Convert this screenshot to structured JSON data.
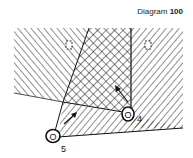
{
  "title": {
    "prefix": "Diagram",
    "number": "100"
  },
  "players": [
    {
      "id": "player-4",
      "label": "4",
      "x": 128,
      "y": 114
    },
    {
      "id": "player-5",
      "label": "5",
      "x": 53,
      "y": 137
    }
  ],
  "markers": [
    {
      "id": "dashed-marker-left",
      "x": 69,
      "y": 45
    },
    {
      "id": "dashed-marker-right",
      "x": 148,
      "y": 45
    }
  ],
  "zones": [
    {
      "id": "left-hatched-zone",
      "pattern": "diagonal-right"
    },
    {
      "id": "center-crosshatched-zone",
      "pattern": "crosshatch"
    },
    {
      "id": "right-hatched-zone",
      "pattern": "diagonal-left"
    },
    {
      "id": "lower-hatched-zone",
      "pattern": "diagonal-left"
    }
  ],
  "arrows": [
    {
      "id": "arrow-player-4",
      "direction": "up-left"
    },
    {
      "id": "arrow-player-5",
      "direction": "up-right"
    }
  ],
  "colors": {
    "ink": "#111111",
    "background": "#ffffff"
  }
}
